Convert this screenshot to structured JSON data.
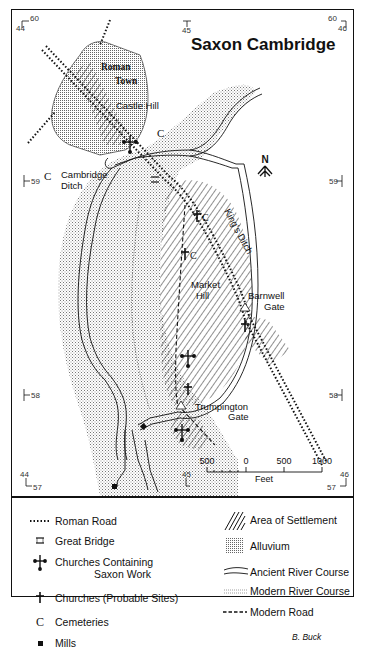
{
  "title": "Saxon Cambridge",
  "grid": {
    "top_left": {
      "easting": "44",
      "northing": "60"
    },
    "top_center": {
      "easting": "45"
    },
    "top_right": {
      "easting": "46",
      "northing": "60"
    },
    "left_59": "59",
    "right_59": "59",
    "left_58": "58",
    "right_58": "58",
    "bottom_left": {
      "easting": "44",
      "northing": "57"
    },
    "bottom_center": {
      "easting": "45"
    },
    "bottom_right": {
      "easting": "46",
      "northing": "57"
    }
  },
  "places": {
    "roman_town_1": "Roman",
    "roman_town_2": "Town",
    "castle_hill": "Castle Hill",
    "cambridge_ditch_1": "Cambridge",
    "cambridge_ditch_2": "Ditch",
    "kings_ditch": "King's Ditch",
    "market_hill_1": "Market",
    "market_hill_2": "Hill",
    "barnwell_gate_1": "Barnwell",
    "barnwell_gate_2": "Gate",
    "trumpington_gate_1": "Trumpington",
    "trumpington_gate_2": "Gate",
    "cemetery_mark": "C"
  },
  "north_arrow": {
    "label": "N"
  },
  "scale_bar": {
    "labels": [
      "500",
      "0",
      "500",
      "1000"
    ],
    "unit": "Feet"
  },
  "legend": {
    "left": [
      {
        "symbol": "roman-road",
        "label": "Roman Road"
      },
      {
        "symbol": "great-bridge",
        "label": "Great Bridge"
      },
      {
        "symbol": "saxon-church",
        "label": "Churches Containing",
        "label2": "Saxon Work"
      },
      {
        "symbol": "probable-church",
        "label": "Churches (Probable Sites)"
      },
      {
        "symbol": "cemetery",
        "label": "Cemeteries",
        "glyph": "C"
      },
      {
        "symbol": "mill",
        "label": "Mills"
      }
    ],
    "right": [
      {
        "symbol": "settlement-hatch",
        "label": "Area of Settlement"
      },
      {
        "symbol": "alluvium-stipple",
        "label": "Alluvium"
      },
      {
        "symbol": "ancient-river",
        "label": "Ancient River Course"
      },
      {
        "symbol": "modern-river",
        "label": "Modern River Course"
      },
      {
        "symbol": "modern-road",
        "label": "Modern Road"
      }
    ]
  },
  "credit": "B. Buck"
}
